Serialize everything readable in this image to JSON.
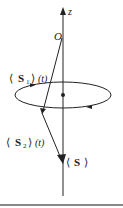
{
  "diagram": {
    "axis_label": "z",
    "origin_label": "O",
    "s1_label": {
      "open": "⟨",
      "symbol": "S",
      "sub": "1",
      "close": "⟩",
      "arg": "(t)"
    },
    "s2_label": {
      "open": "⟨",
      "symbol": "S",
      "sub": "2",
      "close": "⟩",
      "arg": "(t)"
    },
    "s_label": {
      "open": "⟨",
      "symbol": "S",
      "close": "⟩"
    },
    "colors": {
      "stroke": "#222222",
      "footer_rule": "#888888"
    }
  }
}
